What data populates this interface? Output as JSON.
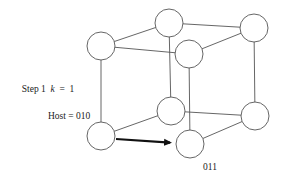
{
  "diagram": {
    "type": "hypercube-3d",
    "title_label": {
      "step": "Step 1",
      "var": "k",
      "eq": "=",
      "value": "1"
    },
    "host_label": "Host = 010",
    "dest_label": "011",
    "colors": {
      "edge": "#555555",
      "node_stroke": "#555555",
      "node_fill": "#ffffff",
      "arrow": "#111111",
      "text": "#222222"
    },
    "node_radius": 14,
    "nodes": [
      {
        "id": "A",
        "name": "top-left-front",
        "x": 101,
        "y": 46
      },
      {
        "id": "B",
        "name": "top-back",
        "x": 169,
        "y": 23
      },
      {
        "id": "C",
        "name": "top-right-back",
        "x": 254,
        "y": 28
      },
      {
        "id": "D",
        "name": "top-front-right",
        "x": 189,
        "y": 54
      },
      {
        "id": "E",
        "name": "host-010",
        "x": 101,
        "y": 136
      },
      {
        "id": "F",
        "name": "bottom-back",
        "x": 171,
        "y": 111
      },
      {
        "id": "G",
        "name": "bottom-right-back",
        "x": 255,
        "y": 116
      },
      {
        "id": "H",
        "name": "dest-011",
        "x": 190,
        "y": 144
      }
    ],
    "edges": [
      [
        "A",
        "B"
      ],
      [
        "A",
        "D"
      ],
      [
        "B",
        "C"
      ],
      [
        "C",
        "D"
      ],
      [
        "A",
        "E"
      ],
      [
        "B",
        "F"
      ],
      [
        "C",
        "G"
      ],
      [
        "D",
        "H"
      ],
      [
        "E",
        "F"
      ],
      [
        "F",
        "G"
      ],
      [
        "G",
        "H"
      ]
    ],
    "arrow": {
      "from": "E",
      "to": "H",
      "x1": 116,
      "y1": 139,
      "x2": 174,
      "y2": 143
    }
  }
}
